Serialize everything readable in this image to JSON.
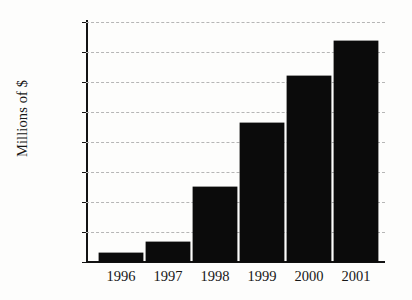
{
  "chart_data": {
    "type": "bar",
    "title": "",
    "xlabel": "",
    "ylabel": "Millions of $",
    "categories": [
      "1996",
      "1997",
      "1998",
      "1999",
      "2000",
      "2001"
    ],
    "values": [
      60,
      135,
      500,
      930,
      1240,
      1475
    ],
    "ylim": [
      0,
      1600
    ],
    "ytick_labels": [
      "0",
      "200",
      "400",
      "600",
      "800",
      "1000",
      "1200",
      "1400",
      "1600"
    ],
    "ytick_values": [
      0,
      200,
      400,
      600,
      800,
      1000,
      1200,
      1400,
      1600
    ],
    "grid": true,
    "grid_axis": "y",
    "grid_style": "dashed",
    "legend": false,
    "legend_position": "none",
    "series": [
      {
        "name": "Revenue",
        "values": [
          60,
          135,
          500,
          930,
          1240,
          1475
        ]
      }
    ],
    "colors": {
      "bar": "#0b0b0b",
      "axis": "#131313",
      "grid": "#b6b6b6",
      "background": "#fdfdfc",
      "text": "#171717"
    }
  }
}
